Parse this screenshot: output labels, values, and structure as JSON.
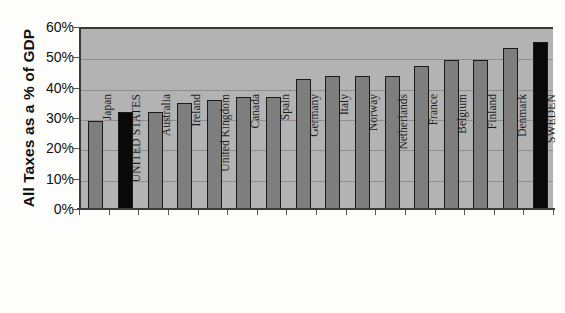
{
  "chart_data": {
    "type": "bar",
    "title": "",
    "xlabel": "",
    "ylabel": "All Taxes as a % of GDP",
    "ylim": [
      0,
      60
    ],
    "ytick_labels": [
      "60%",
      "50%",
      "40%",
      "30%",
      "20%",
      "10%",
      "0%"
    ],
    "ytick_values": [
      60,
      50,
      40,
      30,
      20,
      10,
      0
    ],
    "grid": true,
    "legend": "none",
    "categories": [
      "Japan",
      "UNITED STATES",
      "Australia",
      "Ireland",
      "United Kingdom",
      "Canada",
      "Spain",
      "Germany",
      "Italy",
      "Norway",
      "Netherlands",
      "France",
      "Belgium",
      "Finland",
      "Denmark",
      "SWEDEN"
    ],
    "values": [
      29,
      32,
      32,
      35,
      36,
      37,
      37,
      43,
      44,
      44,
      44,
      47,
      49,
      49,
      53,
      55
    ],
    "highlighted": [
      "UNITED STATES",
      "SWEDEN"
    ],
    "colors": {
      "bar_default": "#7e7e7e",
      "bar_highlight": "#090909",
      "bar_outline": "#1a1a1a",
      "plot_background": "#b3b3b3",
      "gridline": "#8d8d8d",
      "axis": "#3a3a3a",
      "page_background": "#fdfdfb",
      "text": "#111111"
    }
  }
}
